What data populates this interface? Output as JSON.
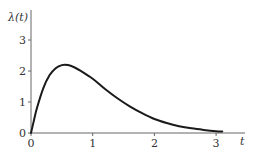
{
  "chart_data": {
    "type": "line",
    "title": "",
    "xlabel": "t",
    "ylabel": "λ(t)",
    "xlim": [
      0,
      3.5
    ],
    "ylim": [
      0,
      3.6
    ],
    "xticks": [
      0,
      1,
      2,
      3
    ],
    "yticks": [
      0,
      1,
      2,
      3
    ],
    "xtick_labels": [
      "0",
      "1",
      "2",
      "3"
    ],
    "ytick_labels": [
      "0",
      "1",
      "2",
      "3"
    ],
    "grid": false,
    "legend": null,
    "series": [
      {
        "name": "λ(t)",
        "color": "#1a1a1a",
        "x": [
          0,
          0.05,
          0.1,
          0.2,
          0.3,
          0.4,
          0.5,
          0.6,
          0.7,
          0.8,
          1.0,
          1.2,
          1.4,
          1.6,
          1.8,
          2.0,
          2.2,
          2.4,
          2.6,
          2.8,
          3.0,
          3.1
        ],
        "y": [
          0,
          0.43,
          0.83,
          1.45,
          1.86,
          2.09,
          2.19,
          2.19,
          2.12,
          2.01,
          1.75,
          1.42,
          1.12,
          0.86,
          0.64,
          0.45,
          0.32,
          0.22,
          0.15,
          0.1,
          0.06,
          0.05
        ]
      }
    ]
  }
}
